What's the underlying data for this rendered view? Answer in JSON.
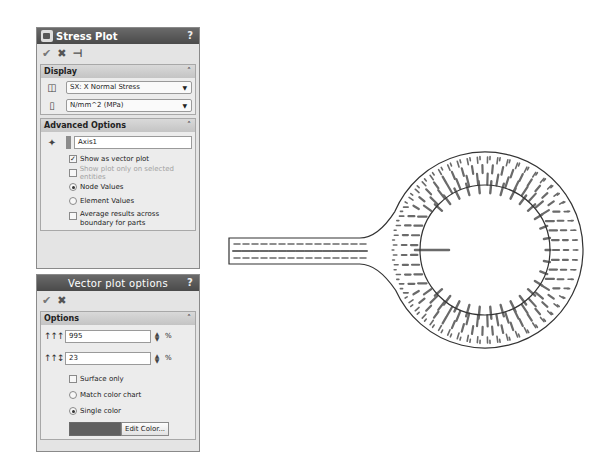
{
  "stress_panel": {
    "title": "Stress Plot",
    "help": "?",
    "actions": {
      "ok": "✔",
      "cancel": "✖",
      "pin": "⊣"
    },
    "display": {
      "header": "Display",
      "component_select": "SX: X Normal Stress",
      "units_select": "N/mm^2 (MPa)"
    },
    "advanced": {
      "header": "Advanced Options",
      "axis_value": "Axis1",
      "show_vector_plot": {
        "label": "Show as vector plot",
        "checked": true
      },
      "show_selected_only": {
        "label": "Show plot only on selected entities",
        "checked": false,
        "disabled": true
      },
      "node_values": {
        "label": "Node Values",
        "selected": true
      },
      "element_values": {
        "label": "Element Values",
        "selected": false
      },
      "average_results": {
        "label": "Average results across boundary for parts",
        "checked": false
      }
    }
  },
  "vector_panel": {
    "title": "Vector plot options",
    "help": "?",
    "actions": {
      "ok": "✔",
      "cancel": "✖"
    },
    "options": {
      "header": "Options",
      "size_value": "995",
      "size_unit": "%",
      "density_value": "23",
      "density_unit": "%",
      "surface_only": {
        "label": "Surface only",
        "checked": false
      },
      "match_color_chart": {
        "label": "Match color chart",
        "selected": false
      },
      "single_color": {
        "label": "Single color",
        "selected": true
      },
      "swatch_color": "#5f5f5f",
      "edit_color_label": "Edit Color..."
    }
  },
  "diagram": {
    "beam": {
      "x1": 229,
      "y1": 238,
      "x2": 420,
      "y2": 264
    },
    "outer_circle": {
      "cx": 485,
      "cy": 250,
      "r": 98
    },
    "inner_circle": {
      "cx": 485,
      "cy": 250,
      "r": 65
    },
    "line_color": "#333333",
    "arrow_color": "#6a6a6a"
  }
}
